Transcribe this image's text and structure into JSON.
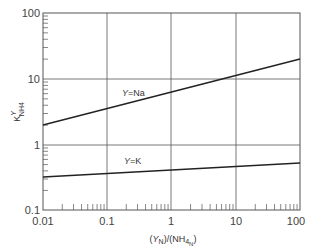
{
  "chart_data": {
    "type": "line",
    "title": "",
    "xlabel": "(Y_N)/(NH4_N)",
    "ylabel": "K^Y_NH4",
    "xscale": "log",
    "yscale": "log",
    "xlim": [
      0.01,
      100
    ],
    "ylim": [
      0.1,
      100
    ],
    "grid": true,
    "x_ticks": [
      "0.01",
      "0.1",
      "1",
      "10",
      "100"
    ],
    "y_ticks": [
      "0.1",
      "1",
      "10",
      "100"
    ],
    "series": [
      {
        "name": "Y=Na",
        "x": [
          0.01,
          100
        ],
        "values": [
          2.0,
          20.0
        ]
      },
      {
        "name": "Y=K",
        "x": [
          0.01,
          100
        ],
        "values": [
          0.32,
          0.53
        ]
      }
    ],
    "annotations": [
      {
        "text": "Y=Na",
        "x": 0.05,
        "y": 4.5
      },
      {
        "text": "Y=K",
        "x": 0.05,
        "y": 0.47
      }
    ]
  },
  "labels": {
    "x_ticks": [
      "0.01",
      "0.1",
      "1",
      "10",
      "100"
    ],
    "y_ticks": [
      "100",
      "10",
      "1",
      "0.1"
    ],
    "ann_na_sym": "Y",
    "ann_na_rest": "=Na",
    "ann_k_sym": "Y",
    "ann_k_rest": "=K",
    "xlabel_open": "(",
    "xlabel_y": "Y",
    "xlabel_n1": "N",
    "xlabel_mid": ")/(NH",
    "xlabel_4": "4",
    "xlabel_n2": "N",
    "xlabel_close": ")",
    "ylabel_k": "K",
    "ylabel_sup": "Y",
    "ylabel_sub": "NH4"
  }
}
